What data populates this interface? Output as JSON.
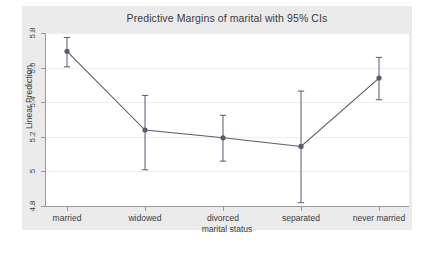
{
  "chart_data": {
    "type": "line",
    "title": "Predictive Margins of marital with 95% CIs",
    "xlabel": "marital status",
    "ylabel": "Linear Prediction",
    "categories": [
      "married",
      "widowed",
      "divorced",
      "separated",
      "never married"
    ],
    "values": [
      5.7,
      5.245,
      5.2,
      5.15,
      5.545
    ],
    "ci_low": [
      5.61,
      5.015,
      5.065,
      4.825,
      5.42
    ],
    "ci_high": [
      5.78,
      5.445,
      5.33,
      5.47,
      5.665
    ],
    "yticks": [
      "4.8",
      "5",
      "5.2",
      "5.4",
      "5.6",
      "5.8"
    ],
    "ytick_values": [
      4.8,
      5.0,
      5.2,
      5.4,
      5.6,
      5.8
    ],
    "ylim": [
      4.8,
      5.8
    ],
    "grid": true,
    "legend": "none",
    "marker": "filled-circle",
    "error_bars": "95% CI with caps",
    "series_color": "#5a5a6e",
    "grid_color": "#f0f0f0",
    "axis_color": "#9a9a9a",
    "plot_background": "#ffffff",
    "graph_background": "#ebebeb"
  }
}
